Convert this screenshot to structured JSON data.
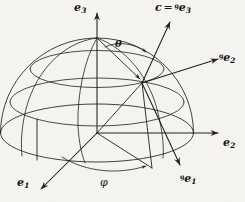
{
  "figure": {
    "background_color": "#f7f6f3",
    "ink_color": "#1a1a1a",
    "labels": {
      "e3": {
        "base": "e",
        "sub": "3",
        "prescript": "",
        "text": "e3"
      },
      "director": {
        "lhs": "c",
        "eq": "=",
        "prescript": "g",
        "base": "e",
        "sub": "3",
        "text": "c = ge3"
      },
      "ge2": {
        "prescript": "g",
        "base": "e",
        "sub": "2",
        "text": "ge2"
      },
      "e2": {
        "base": "e",
        "sub": "2",
        "prescript": "",
        "text": "e2"
      },
      "e1": {
        "base": "e",
        "sub": "1",
        "prescript": "",
        "text": "e1"
      },
      "ge1": {
        "prescript": "g",
        "base": "e",
        "sub": "1",
        "text": "ge1"
      },
      "theta": {
        "text": "θ",
        "meaning": "polar-angle"
      },
      "phi": {
        "text": "φ",
        "meaning": "azimuthal-angle"
      }
    },
    "geometry": {
      "origin": [
        97,
        133
      ],
      "apex": [
        97,
        38
      ],
      "contact_point": [
        142,
        83
      ],
      "sphere_center": [
        97,
        133
      ],
      "sphere_radius_x": 97,
      "sphere_radius_y": 95,
      "equator_ry": 28,
      "latitude_circles": 2,
      "meridians": 3,
      "axes": [
        {
          "name": "e1",
          "from": [
            97,
            133
          ],
          "to": [
            40,
            190
          ]
        },
        {
          "name": "e2",
          "from": [
            97,
            133
          ],
          "to": [
            221,
            133
          ]
        },
        {
          "name": "e3",
          "from": [
            97,
            133
          ],
          "to": [
            97,
            12
          ]
        }
      ],
      "rotated_axes": [
        {
          "name": "ge1",
          "from": [
            142,
            83
          ],
          "to": [
            182,
            168
          ]
        },
        {
          "name": "ge2",
          "from": [
            142,
            83
          ],
          "to": [
            222,
            58
          ]
        },
        {
          "name": "ge3",
          "from": [
            142,
            83
          ],
          "to": [
            172,
            23
          ]
        }
      ],
      "theta_arc": {
        "from_vector": "e3",
        "to_vector": "c",
        "vertex": [
          97,
          38
        ]
      },
      "phi_arc": {
        "plane": "equatorial",
        "vertex": [
          97,
          133
        ]
      }
    }
  }
}
